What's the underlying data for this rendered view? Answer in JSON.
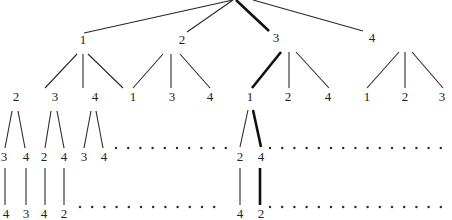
{
  "diagram": {
    "type": "permutation-tree",
    "colors": {
      "line": "#2a2a2a",
      "highlight": "#111111",
      "text": "#222222",
      "background": "#ffffff"
    },
    "root": {
      "x": 233,
      "y": 0
    },
    "nodes": [
      {
        "id": "n1",
        "label": "1",
        "x": 83,
        "y": 44,
        "level": 1
      },
      {
        "id": "n2",
        "label": "2",
        "x": 182,
        "y": 44,
        "level": 1
      },
      {
        "id": "n3",
        "label": "3",
        "x": 276,
        "y": 42,
        "level": 1
      },
      {
        "id": "n4",
        "label": "4",
        "x": 372,
        "y": 42,
        "level": 1
      },
      {
        "id": "n12",
        "label": "2",
        "x": 16,
        "y": 101,
        "level": 2
      },
      {
        "id": "n13",
        "label": "3",
        "x": 55,
        "y": 101,
        "level": 2
      },
      {
        "id": "n14",
        "label": "4",
        "x": 95,
        "y": 101,
        "level": 2
      },
      {
        "id": "n21",
        "label": "1",
        "x": 133,
        "y": 101,
        "level": 2
      },
      {
        "id": "n23",
        "label": "3",
        "x": 172,
        "y": 101,
        "level": 2
      },
      {
        "id": "n24",
        "label": "4",
        "x": 210,
        "y": 101,
        "level": 2
      },
      {
        "id": "n31",
        "label": "1",
        "x": 250,
        "y": 101,
        "level": 2
      },
      {
        "id": "n32",
        "label": "2",
        "x": 288,
        "y": 101,
        "level": 2
      },
      {
        "id": "n34",
        "label": "4",
        "x": 328,
        "y": 101,
        "level": 2
      },
      {
        "id": "n41",
        "label": "1",
        "x": 367,
        "y": 101,
        "level": 2
      },
      {
        "id": "n42",
        "label": "2",
        "x": 405,
        "y": 101,
        "level": 2
      },
      {
        "id": "n43",
        "label": "3",
        "x": 442,
        "y": 101,
        "level": 2
      },
      {
        "id": "n123",
        "label": "3",
        "x": 4,
        "y": 161,
        "level": 3
      },
      {
        "id": "n124",
        "label": "4",
        "x": 26,
        "y": 161,
        "level": 3
      },
      {
        "id": "n132",
        "label": "2",
        "x": 44,
        "y": 161,
        "level": 3
      },
      {
        "id": "n134",
        "label": "4",
        "x": 64,
        "y": 161,
        "level": 3
      },
      {
        "id": "n143",
        "label": "3",
        "x": 84,
        "y": 161,
        "level": 3
      },
      {
        "id": "n144",
        "label": "4",
        "x": 104,
        "y": 161,
        "level": 3
      },
      {
        "id": "n312",
        "label": "2",
        "x": 240,
        "y": 161,
        "level": 3
      },
      {
        "id": "n314",
        "label": "4",
        "x": 261,
        "y": 161,
        "level": 3
      },
      {
        "id": "n1234",
        "label": "4",
        "x": 6,
        "y": 218,
        "level": 4
      },
      {
        "id": "n1243",
        "label": "3",
        "x": 26,
        "y": 218,
        "level": 4
      },
      {
        "id": "n1324",
        "label": "4",
        "x": 44,
        "y": 218,
        "level": 4
      },
      {
        "id": "n1342",
        "label": "2",
        "x": 64,
        "y": 218,
        "level": 4
      },
      {
        "id": "n3124",
        "label": "4",
        "x": 240,
        "y": 218,
        "level": 4
      },
      {
        "id": "n3142",
        "label": "2",
        "x": 261,
        "y": 218,
        "level": 4
      }
    ],
    "edges": [
      {
        "x1": 233,
        "y1": 0,
        "x2": 84,
        "y2": 33,
        "bold": false
      },
      {
        "x1": 233,
        "y1": 0,
        "x2": 187,
        "y2": 32,
        "bold": false
      },
      {
        "x1": 236,
        "y1": 0,
        "x2": 269,
        "y2": 31,
        "bold": true
      },
      {
        "x1": 253,
        "y1": 0,
        "x2": 363,
        "y2": 31,
        "bold": false
      },
      {
        "x1": 77,
        "y1": 54,
        "x2": 45,
        "y2": 88,
        "bold": false
      },
      {
        "x1": 83,
        "y1": 54,
        "x2": 83,
        "y2": 88,
        "bold": false
      },
      {
        "x1": 88,
        "y1": 54,
        "x2": 123,
        "y2": 88,
        "bold": false
      },
      {
        "x1": 163,
        "y1": 54,
        "x2": 133,
        "y2": 88,
        "bold": false
      },
      {
        "x1": 171,
        "y1": 54,
        "x2": 171,
        "y2": 88,
        "bold": false
      },
      {
        "x1": 180,
        "y1": 54,
        "x2": 210,
        "y2": 88,
        "bold": false
      },
      {
        "x1": 281,
        "y1": 52,
        "x2": 252,
        "y2": 88,
        "bold": true
      },
      {
        "x1": 289,
        "y1": 52,
        "x2": 289,
        "y2": 88,
        "bold": false
      },
      {
        "x1": 296,
        "y1": 52,
        "x2": 329,
        "y2": 88,
        "bold": false
      },
      {
        "x1": 399,
        "y1": 52,
        "x2": 367,
        "y2": 88,
        "bold": false
      },
      {
        "x1": 405,
        "y1": 52,
        "x2": 405,
        "y2": 88,
        "bold": false
      },
      {
        "x1": 412,
        "y1": 52,
        "x2": 443,
        "y2": 88,
        "bold": false
      },
      {
        "x1": 12,
        "y1": 111,
        "x2": 5,
        "y2": 148,
        "bold": false
      },
      {
        "x1": 18,
        "y1": 111,
        "x2": 25,
        "y2": 148,
        "bold": false
      },
      {
        "x1": 51,
        "y1": 111,
        "x2": 45,
        "y2": 148,
        "bold": false
      },
      {
        "x1": 57,
        "y1": 111,
        "x2": 64,
        "y2": 148,
        "bold": false
      },
      {
        "x1": 91,
        "y1": 111,
        "x2": 84,
        "y2": 148,
        "bold": false
      },
      {
        "x1": 96,
        "y1": 111,
        "x2": 103,
        "y2": 148,
        "bold": false
      },
      {
        "x1": 248,
        "y1": 110,
        "x2": 240,
        "y2": 147,
        "bold": false
      },
      {
        "x1": 253,
        "y1": 110,
        "x2": 261,
        "y2": 147,
        "bold": true
      },
      {
        "x1": 5,
        "y1": 168,
        "x2": 5,
        "y2": 205,
        "bold": false
      },
      {
        "x1": 26,
        "y1": 168,
        "x2": 26,
        "y2": 205,
        "bold": false
      },
      {
        "x1": 45,
        "y1": 168,
        "x2": 45,
        "y2": 205,
        "bold": false
      },
      {
        "x1": 64,
        "y1": 168,
        "x2": 64,
        "y2": 205,
        "bold": false
      },
      {
        "x1": 240,
        "y1": 168,
        "x2": 240,
        "y2": 205,
        "bold": false
      },
      {
        "x1": 260,
        "y1": 168,
        "x2": 260,
        "y2": 205,
        "bold": true
      }
    ],
    "dotted_rows": [
      {
        "y": 148,
        "segments": [
          {
            "x1": 116,
            "x2": 226
          },
          {
            "x1": 270,
            "x2": 452
          }
        ]
      },
      {
        "y": 207,
        "segments": [
          {
            "x1": 80,
            "x2": 226
          },
          {
            "x1": 270,
            "x2": 452
          }
        ]
      }
    ],
    "highlighted_path": [
      "3",
      "1",
      "4",
      "2"
    ]
  }
}
